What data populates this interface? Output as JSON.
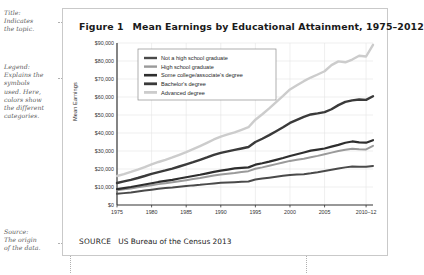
{
  "figure": {
    "number": "Figure 1",
    "title": "Mean Earnings by Educational Attainment, 1975–2012",
    "source_keyword": "SOURCE",
    "source_text": "US Bureau of the Census 2013"
  },
  "annotations": [
    {
      "name": "title-annotation",
      "lines": [
        "Title:",
        "Indicates",
        "the topic."
      ]
    },
    {
      "name": "legend-annotation",
      "lines": [
        "Legend:",
        "Explains the",
        "symbols",
        "used. Here,",
        "colors show",
        "the different",
        "categories."
      ]
    },
    {
      "name": "source-annotation",
      "lines": [
        "Source:",
        "The origin",
        "of the data."
      ]
    }
  ],
  "chart_data": {
    "type": "line",
    "title": "Mean Earnings by Educational Attainment, 1975–2012",
    "xlabel": "",
    "ylabel": "Mean Earnings",
    "xlim": [
      1975,
      2012
    ],
    "ylim": [
      0,
      90000
    ],
    "grid": true,
    "legend_position": "upper-left-inside",
    "x_tick_labels": [
      "1975",
      "1980",
      "1985",
      "1990",
      "1995",
      "2000",
      "2005",
      "2010–12"
    ],
    "x_tick_values": [
      1975,
      1980,
      1985,
      1990,
      1995,
      2000,
      2005,
      2011
    ],
    "y_tick_labels": [
      "$0",
      "$10,000",
      "$20,000",
      "$30,000",
      "$40,000",
      "$50,000",
      "$60,000",
      "$70,000",
      "$80,000",
      "$90,000"
    ],
    "y_tick_values": [
      0,
      10000,
      20000,
      30000,
      40000,
      50000,
      60000,
      70000,
      80000,
      90000
    ],
    "x": [
      1975,
      1976,
      1977,
      1978,
      1979,
      1980,
      1981,
      1982,
      1983,
      1984,
      1985,
      1986,
      1987,
      1988,
      1989,
      1990,
      1991,
      1992,
      1993,
      1994,
      1995,
      1996,
      1997,
      1998,
      1999,
      2000,
      2001,
      2002,
      2003,
      2004,
      2005,
      2006,
      2007,
      2008,
      2009,
      2010,
      2011,
      2012
    ],
    "series": [
      {
        "name": "Not a high school graduate",
        "color": "#4a4a4a",
        "width": 2.0,
        "values": [
          6200,
          6600,
          7000,
          7500,
          8000,
          8500,
          9000,
          9400,
          9700,
          10100,
          10500,
          10900,
          11200,
          11600,
          12000,
          12300,
          12500,
          12700,
          12900,
          13100,
          14200,
          14700,
          15200,
          15700,
          16200,
          16700,
          16900,
          17100,
          17600,
          18200,
          18900,
          19600,
          20300,
          20900,
          21400,
          21300,
          21200,
          21700
        ]
      },
      {
        "name": "High school graduate",
        "color": "#9a9a9a",
        "width": 2.0,
        "values": [
          8200,
          8700,
          9200,
          9800,
          10400,
          11000,
          11600,
          12100,
          12600,
          13200,
          13800,
          14400,
          15000,
          15700,
          16400,
          17000,
          17400,
          17800,
          18300,
          18800,
          20100,
          20900,
          21800,
          22700,
          23600,
          24500,
          25100,
          25700,
          26500,
          27300,
          28200,
          29100,
          30000,
          30700,
          31200,
          31000,
          30900,
          32900
        ]
      },
      {
        "name": "Some college/associate's degree",
        "color": "#2e2e2e",
        "width": 2.2,
        "values": [
          8800,
          9400,
          10000,
          10700,
          11400,
          12100,
          12800,
          13400,
          14000,
          14700,
          15400,
          16100,
          16800,
          17600,
          18400,
          19100,
          19700,
          20300,
          20600,
          20900,
          22400,
          23200,
          24100,
          25100,
          26100,
          27200,
          28200,
          29200,
          30200,
          30800,
          31400,
          32400,
          33400,
          34600,
          35300,
          34800,
          34600,
          36000
        ]
      },
      {
        "name": "Bachelor's degree",
        "color": "#3a3a3a",
        "width": 2.4,
        "values": [
          12200,
          13100,
          14000,
          15000,
          16100,
          17300,
          18300,
          19200,
          20200,
          21400,
          22600,
          23800,
          25100,
          26400,
          27800,
          29000,
          29800,
          30600,
          31400,
          32200,
          35000,
          36800,
          38800,
          41000,
          43200,
          45600,
          47300,
          49000,
          50300,
          50900,
          51600,
          53200,
          55500,
          57300,
          58100,
          58600,
          58400,
          60400
        ]
      },
      {
        "name": "Advanced degree",
        "color": "#cccccc",
        "width": 2.4,
        "values": [
          16100,
          17200,
          18400,
          19700,
          21100,
          22600,
          23900,
          25100,
          26400,
          27900,
          29400,
          31000,
          32700,
          34500,
          36400,
          38000,
          39200,
          40400,
          41800,
          43200,
          47400,
          50400,
          53700,
          57200,
          60600,
          64200,
          66500,
          68800,
          70800,
          72500,
          74300,
          77700,
          79800,
          79300,
          80800,
          82900,
          82500,
          89000
        ]
      }
    ]
  }
}
